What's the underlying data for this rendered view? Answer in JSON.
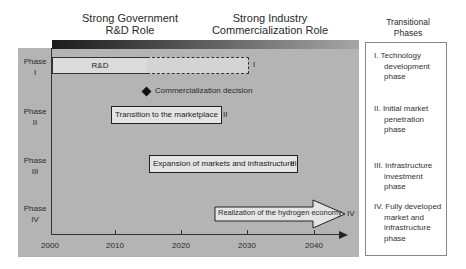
{
  "headers": {
    "government": [
      "Strong Government",
      "R&D Role"
    ],
    "industry": [
      "Strong Industry",
      "Commercialization Role"
    ],
    "phases": [
      "Transitional",
      "Phases"
    ]
  },
  "phase_labels": [
    {
      "word": "Phase",
      "num": "I"
    },
    {
      "word": "Phase",
      "num": "II"
    },
    {
      "word": "Phase",
      "num": "III"
    },
    {
      "word": "Phase",
      "num": "IV"
    }
  ],
  "timeline": {
    "axis_ticks": [
      "2000",
      "2010",
      "2020",
      "2030",
      "2040"
    ],
    "rd_label": "R&D",
    "rd_roman": "I",
    "decision": "Commercialization decision",
    "phase2_label": "Transition to the marketplace",
    "phase2_roman": "II",
    "phase3_label": "Expansion of markets and infrastructure",
    "phase3_roman": "III",
    "phase4_label": "Realization of the hydrogen economy",
    "phase4_roman": "IV"
  },
  "transitional_phases": [
    {
      "first": "I. Technology",
      "rest": [
        "development",
        "phase"
      ]
    },
    {
      "first": "II. Initial market",
      "rest": [
        "penetration",
        "phase"
      ]
    },
    {
      "first": "III. Infrastructure",
      "rest": [
        "investment",
        "phase"
      ]
    },
    {
      "first": "IV. Fully developed",
      "rest": [
        "market and",
        "infrastructure",
        "phase"
      ]
    }
  ],
  "colors": {
    "panel": "#b4b4b4",
    "gradient_start": "#1c1c1c",
    "gradient_end": "#a6a6a6",
    "box_fill": "#e4e4e4"
  }
}
